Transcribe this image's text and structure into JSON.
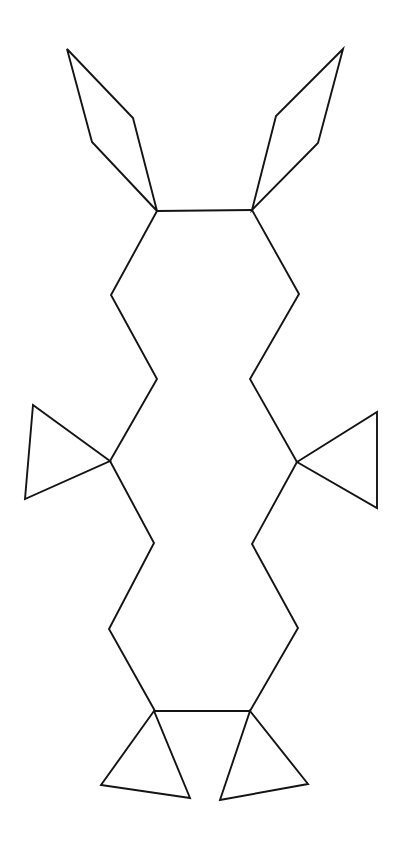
{
  "document": {
    "title": "Polygonal Creature Line Drawing",
    "description": "Black outline line-art figure on a plain white background, drawn as straight-segment polygons: a tall central body with two pointed ears at the top, two triangular arms at mid-height, and two triangular feet at the bottom.",
    "width": 405,
    "height": 845
  },
  "canvas": {
    "background_color": "#ffffff",
    "stroke_color": "#141414",
    "stroke_width": 1.9,
    "line_cap": "round",
    "line_join": "miter"
  },
  "figure": {
    "name": "polygonal-creature-outline",
    "symmetry": "bilateral-vertical",
    "axis_x": 204,
    "parts": [
      {
        "name": "left-ear",
        "type": "polygon",
        "closed": true,
        "points": "67,49 133,118 157,211 92,142"
      },
      {
        "name": "right-ear",
        "type": "polygon",
        "closed": true,
        "points": "343,49 318,143 252,210 276,116"
      },
      {
        "name": "head-top-edge",
        "type": "polyline",
        "closed": false,
        "points": "157,211 252,210"
      },
      {
        "name": "left-body-outline",
        "type": "polyline",
        "closed": false,
        "points": "157,211 111,295 157,379 110,461 154,543 109,629 155,711"
      },
      {
        "name": "right-body-outline",
        "type": "polyline",
        "closed": false,
        "points": "252,210 299,294 250,379 297,462 252,544 298,628 250,711"
      },
      {
        "name": "left-arm-triangle",
        "type": "polygon",
        "closed": true,
        "points": "110,461 33,405 25,499"
      },
      {
        "name": "right-arm-triangle",
        "type": "polygon",
        "closed": true,
        "points": "297,462 377,412 377,508"
      },
      {
        "name": "hip-bottom-edge",
        "type": "polyline",
        "closed": false,
        "points": "155,711 250,711"
      },
      {
        "name": "left-foot-triangle",
        "type": "polygon",
        "closed": true,
        "points": "154,711 101,785 190,798"
      },
      {
        "name": "right-foot-triangle",
        "type": "polygon",
        "closed": true,
        "points": "250,711 308,784 220,800"
      }
    ]
  }
}
